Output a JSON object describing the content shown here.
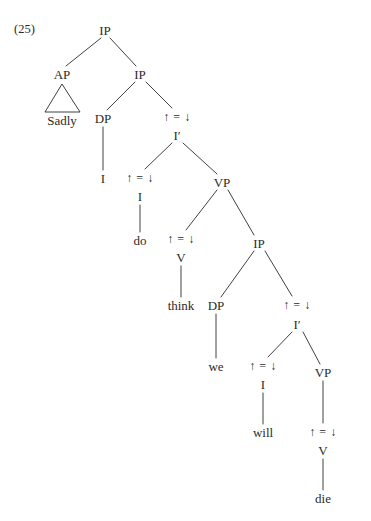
{
  "figure": {
    "example_label": "(25)",
    "sentence": "Sadly I do think we will die",
    "annotation_symbol": "↑ = ↓",
    "ink_color": "#2b2b2b",
    "background_color": "#ffffff",
    "nodes": [
      {
        "id": "n1",
        "text": "IP",
        "kind": "category",
        "x": 105,
        "y": 30
      },
      {
        "id": "n2",
        "text": "AP",
        "kind": "category",
        "x": 62,
        "y": 74
      },
      {
        "id": "n3",
        "text": "IP",
        "kind": "category",
        "x": 140,
        "y": 74
      },
      {
        "id": "n4",
        "text": "Sadly",
        "kind": "terminal",
        "x": 62,
        "y": 120
      },
      {
        "id": "n5",
        "text": "DP",
        "kind": "category",
        "x": 103,
        "y": 118
      },
      {
        "id": "n6",
        "text": "↑ = ↓",
        "kind": "annotation",
        "x": 177,
        "y": 117
      },
      {
        "id": "n7",
        "text": "I′",
        "kind": "category",
        "x": 177,
        "y": 135
      },
      {
        "id": "n8",
        "text": "I",
        "kind": "terminal",
        "x": 103,
        "y": 178
      },
      {
        "id": "n9",
        "text": "↑ = ↓",
        "kind": "annotation",
        "x": 140,
        "y": 178
      },
      {
        "id": "n10",
        "text": "I",
        "kind": "category",
        "x": 140,
        "y": 196
      },
      {
        "id": "n11",
        "text": "VP",
        "kind": "category",
        "x": 222,
        "y": 182
      },
      {
        "id": "n12",
        "text": "do",
        "kind": "terminal",
        "x": 140,
        "y": 240
      },
      {
        "id": "n13",
        "text": "↑ = ↓",
        "kind": "annotation",
        "x": 181,
        "y": 239
      },
      {
        "id": "n14",
        "text": "V",
        "kind": "category",
        "x": 181,
        "y": 257
      },
      {
        "id": "n15",
        "text": "IP",
        "kind": "category",
        "x": 259,
        "y": 243
      },
      {
        "id": "n16",
        "text": "think",
        "kind": "terminal",
        "x": 181,
        "y": 305
      },
      {
        "id": "n17",
        "text": "DP",
        "kind": "category",
        "x": 216,
        "y": 305
      },
      {
        "id": "n18",
        "text": "↑ = ↓",
        "kind": "annotation",
        "x": 297,
        "y": 305
      },
      {
        "id": "n19",
        "text": "I′",
        "kind": "category",
        "x": 297,
        "y": 324
      },
      {
        "id": "n20",
        "text": "we",
        "kind": "terminal",
        "x": 216,
        "y": 366
      },
      {
        "id": "n21",
        "text": "↑ = ↓",
        "kind": "annotation",
        "x": 263,
        "y": 366
      },
      {
        "id": "n22",
        "text": "I",
        "kind": "category",
        "x": 263,
        "y": 384
      },
      {
        "id": "n23",
        "text": "VP",
        "kind": "category",
        "x": 323,
        "y": 372
      },
      {
        "id": "n24",
        "text": "will",
        "kind": "terminal",
        "x": 263,
        "y": 432
      },
      {
        "id": "n25",
        "text": "↑ = ↓",
        "kind": "annotation",
        "x": 323,
        "y": 432
      },
      {
        "id": "n26",
        "text": "V",
        "kind": "category",
        "x": 323,
        "y": 450
      },
      {
        "id": "n27",
        "text": "die",
        "kind": "terminal",
        "x": 323,
        "y": 498
      }
    ],
    "edges": [
      {
        "from": "n1",
        "to": "n2",
        "x1": 101,
        "y1": 38,
        "x2": 66,
        "y2": 66
      },
      {
        "from": "n1",
        "to": "n3",
        "x1": 110,
        "y1": 38,
        "x2": 136,
        "y2": 66
      },
      {
        "from": "n3",
        "to": "n5",
        "x1": 135,
        "y1": 82,
        "x2": 107,
        "y2": 110
      },
      {
        "from": "n3",
        "to": "n6",
        "x1": 146,
        "y1": 82,
        "x2": 172,
        "y2": 108
      },
      {
        "from": "n5",
        "to": "n8",
        "x1": 103,
        "y1": 127,
        "x2": 103,
        "y2": 170
      },
      {
        "from": "n7",
        "to": "n9",
        "x1": 172,
        "y1": 143,
        "x2": 145,
        "y2": 169
      },
      {
        "from": "n7",
        "to": "n11",
        "x1": 183,
        "y1": 143,
        "x2": 217,
        "y2": 174
      },
      {
        "from": "n10",
        "to": "n12",
        "x1": 140,
        "y1": 205,
        "x2": 140,
        "y2": 232
      },
      {
        "from": "n11",
        "to": "n13",
        "x1": 217,
        "y1": 190,
        "x2": 186,
        "y2": 230
      },
      {
        "from": "n11",
        "to": "n15",
        "x1": 228,
        "y1": 190,
        "x2": 254,
        "y2": 235
      },
      {
        "from": "n14",
        "to": "n16",
        "x1": 181,
        "y1": 266,
        "x2": 181,
        "y2": 297
      },
      {
        "from": "n15",
        "to": "n17",
        "x1": 254,
        "y1": 251,
        "x2": 221,
        "y2": 297
      },
      {
        "from": "n15",
        "to": "n18",
        "x1": 265,
        "y1": 251,
        "x2": 292,
        "y2": 296
      },
      {
        "from": "n17",
        "to": "n20",
        "x1": 216,
        "y1": 314,
        "x2": 216,
        "y2": 358
      },
      {
        "from": "n19",
        "to": "n21",
        "x1": 292,
        "y1": 332,
        "x2": 268,
        "y2": 357
      },
      {
        "from": "n19",
        "to": "n23",
        "x1": 303,
        "y1": 332,
        "x2": 320,
        "y2": 364
      },
      {
        "from": "n22",
        "to": "n24",
        "x1": 263,
        "y1": 393,
        "x2": 263,
        "y2": 424
      },
      {
        "from": "n23",
        "to": "n25",
        "x1": 323,
        "y1": 381,
        "x2": 323,
        "y2": 423
      },
      {
        "from": "n26",
        "to": "n27",
        "x1": 323,
        "y1": 459,
        "x2": 323,
        "y2": 490
      }
    ],
    "triangle": {
      "label": "adjunct-triangle",
      "apex_x": 62,
      "apex_y": 84,
      "left_x": 45,
      "left_y": 112,
      "right_x": 80,
      "right_y": 112
    }
  }
}
